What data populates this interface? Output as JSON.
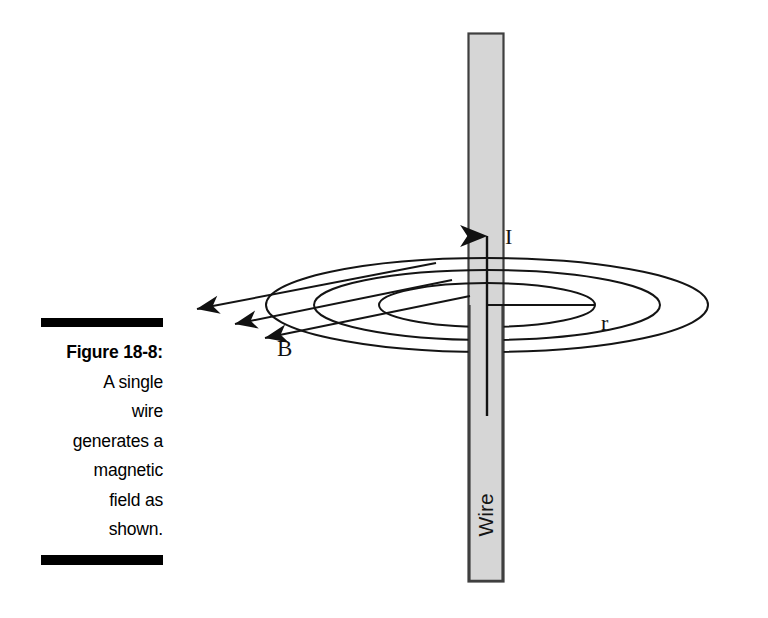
{
  "figure": {
    "caption_number": "Figure 18-8:",
    "caption_lines": [
      "A single",
      "wire",
      "generates a",
      "magnetic",
      "field as",
      "shown."
    ],
    "caption_full": "Figure 18-8: A single wire generates a magnetic field as shown."
  },
  "diagram": {
    "wire_label": "Wire",
    "current_label": "I",
    "radius_label": "r",
    "field_label": "B",
    "colors": {
      "ink": "#000000",
      "wire_fill": "#d4d4d4",
      "wire_stroke": "#3a3a3a",
      "line": "#1a1a1a",
      "background": "#ffffff"
    },
    "wire": {
      "x": 468,
      "y": 33,
      "width": 36,
      "height": 549,
      "orientation": "vertical"
    },
    "current_arrow": {
      "from_y": 415,
      "to_y": 228,
      "x": 487,
      "direction": "up"
    },
    "radius_line": {
      "x1": 487,
      "y1": 305,
      "x2": 595,
      "y2": 305
    },
    "ellipses": [
      {
        "name": "inner-field-line",
        "cx": 487,
        "cy": 305,
        "rx": 108,
        "ry": 22
      },
      {
        "name": "middle-field-line",
        "cx": 487,
        "cy": 305,
        "rx": 173,
        "ry": 35
      },
      {
        "name": "outer-field-line",
        "cx": 487,
        "cy": 305,
        "rx": 221,
        "ry": 47
      }
    ],
    "field_arrows": [
      {
        "name": "field-arrow-outer",
        "tip_x": 190,
        "tip_y": 310
      },
      {
        "name": "field-arrow-middle",
        "tip_x": 228,
        "tip_y": 325
      },
      {
        "name": "field-arrow-inner",
        "tip_x": 258,
        "tip_y": 339
      }
    ]
  }
}
